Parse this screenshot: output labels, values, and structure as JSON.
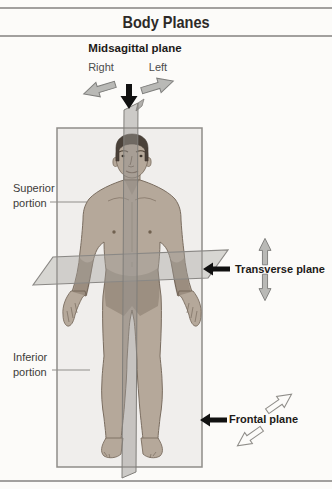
{
  "header": {
    "title": "Body Planes"
  },
  "labels": {
    "midsagittal": "Midsagittal plane",
    "right": "Right",
    "left": "Left",
    "superior": "Superior\nportion",
    "inferior": "Inferior\nportion",
    "transverse": "Transverse plane",
    "frontal": "Frontal plane"
  },
  "colors": {
    "background": "#fcfbf9",
    "rule_gray": "#a2a09e",
    "skin": "#b5a89a",
    "skin_shadow": "#8f7c6b",
    "hair": "#4a4139",
    "plane_fill_gray": "#9a9791",
    "plane_stroke": "#8a8885",
    "solid_arrow_gray": "#b9b9b6",
    "arrow_black": "#111111",
    "text_dark": "#1d1a18"
  }
}
